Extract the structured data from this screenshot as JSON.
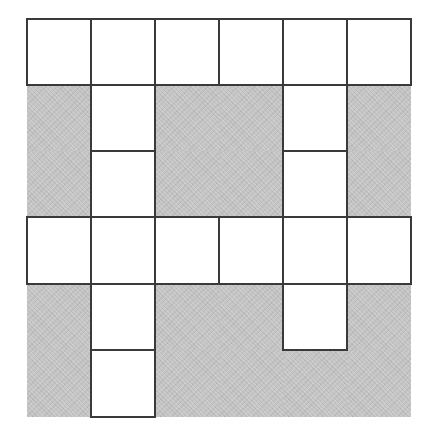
{
  "puzzle": {
    "type": "crossword-grid",
    "rows": 6,
    "cols": 6,
    "legend": {
      "open": "W",
      "blocked": "B"
    },
    "colors": {
      "open_fill": "#ffffff",
      "blocked_fill": "#c6c6c6",
      "line": "#3a3a3a"
    },
    "grid": [
      [
        "W",
        "W",
        "W",
        "W",
        "W",
        "W"
      ],
      [
        "B",
        "W",
        "B",
        "B",
        "W",
        "B"
      ],
      [
        "B",
        "W",
        "B",
        "B",
        "W",
        "B"
      ],
      [
        "W",
        "W",
        "W",
        "W",
        "W",
        "W"
      ],
      [
        "B",
        "W",
        "B",
        "B",
        "W",
        "B"
      ],
      [
        "B",
        "W",
        "B",
        "B",
        "B",
        "B"
      ]
    ],
    "column_edges_px": [
      0,
      64,
      128,
      192,
      256,
      320,
      384
    ],
    "row_edges_px": [
      0,
      66,
      132,
      198,
      265,
      331,
      398
    ],
    "cells": []
  }
}
